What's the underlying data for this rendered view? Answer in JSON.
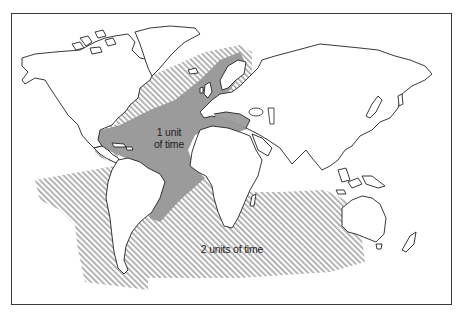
{
  "map": {
    "title": "",
    "zones": [
      {
        "id": "zone-1",
        "label_line1": "1 unit",
        "label_line2": "of time",
        "fill": "#9b9b9b",
        "pattern": "solid",
        "description": "North/Central Atlantic, Caribbean, Mediterranean, western Europe"
      },
      {
        "id": "zone-2",
        "label": "2 units of time",
        "fill": "#aaaaaa",
        "pattern": "diagonal-hatch",
        "description": "Outer Atlantic, South Atlantic, Southern Ocean, Indian Ocean, eastern Pacific off S. America"
      }
    ],
    "colors": {
      "frame": "#3a3a3a",
      "coastline": "#222222",
      "land": "#ffffff",
      "zone1": "#9b9b9b",
      "zone2_hatch": "#aaaaaa"
    },
    "projection": "world map, Atlantic-centred"
  }
}
